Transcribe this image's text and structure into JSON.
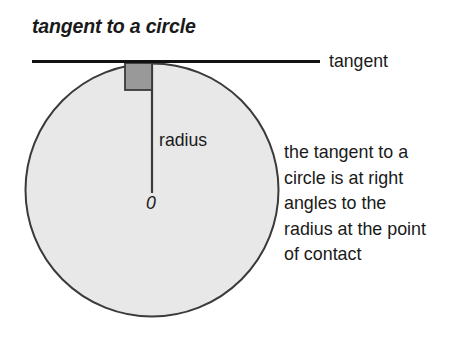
{
  "figure": {
    "title": "tangent to a circle",
    "background_color": "#ffffff",
    "circle": {
      "name": "circle",
      "fill_color": "#e8e8e8",
      "stroke_color": "#3a3a3a",
      "center_x": 152,
      "center_y": 190,
      "radius": 127,
      "center_label": "0"
    },
    "tangent_line": {
      "label": "tangent",
      "stroke_color": "#111111",
      "x_start": 32,
      "x_end": 320,
      "y": 62
    },
    "radius_line": {
      "label": "radius",
      "stroke_color": "#3a3a3a",
      "x": 152,
      "y_start": 63,
      "y_end": 193
    },
    "right_angle_marker": {
      "name": "right-angle-square",
      "fill_color": "#999999",
      "stroke_color": "#3a3a3a",
      "x": 125,
      "y": 63,
      "size": 27
    },
    "description_lines": [
      "the tangent to a",
      "circle is at right",
      "angles to the",
      "radius at the point",
      "of contact"
    ]
  }
}
